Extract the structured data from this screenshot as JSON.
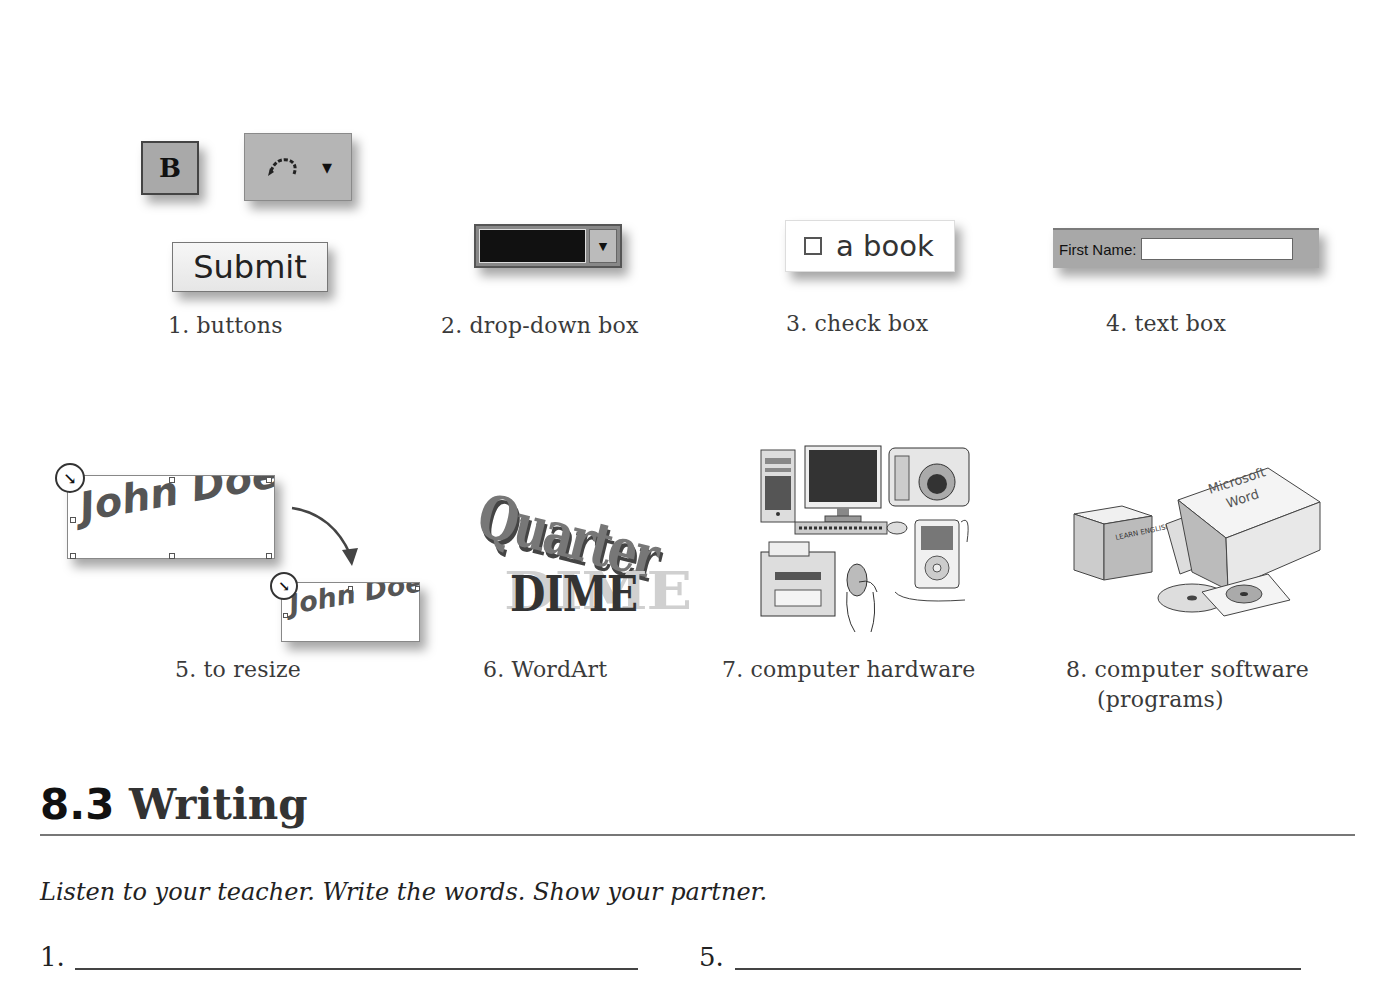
{
  "vocabulary": {
    "items": [
      {
        "number": "1.",
        "label": "buttons",
        "caption": "1. buttons"
      },
      {
        "number": "2.",
        "label": "drop-down box",
        "caption": "2. drop-down box"
      },
      {
        "number": "3.",
        "label": "check box",
        "caption": "3. check box"
      },
      {
        "number": "4.",
        "label": "text box",
        "caption": "4.  text box"
      },
      {
        "number": "5.",
        "label": "to resize",
        "caption": "5. to resize"
      },
      {
        "number": "6.",
        "label": "WordArt",
        "caption": "6. WordArt"
      },
      {
        "number": "7.",
        "label": "computer hardware",
        "caption": "7. computer hardware"
      },
      {
        "number": "8.",
        "label": "computer software (programs)",
        "caption_line1": "8. computer software",
        "caption_line2": "(programs)"
      }
    ]
  },
  "illustrations": {
    "buttons": {
      "bold_glyph": "B",
      "undo_icon": "undo-icon",
      "dropdown_icon": "▾",
      "submit_label": "Submit"
    },
    "dropdown": {
      "arrow": "▼"
    },
    "checkbox": {
      "label": "a book",
      "checked": false
    },
    "textbox": {
      "label": "First Name:",
      "value": ""
    },
    "resize": {
      "large_text": "John Doe",
      "small_text": "John Doe",
      "handle_icon": "↘"
    },
    "wordart": {
      "top_word": "Quarter",
      "bottom_word": "DIME",
      "bottom_word_shadow": "DIME"
    },
    "hardware": {
      "items": [
        "tower",
        "monitor",
        "keyboard",
        "mouse",
        "camera",
        "mp3 player",
        "printer",
        "hand on mouse"
      ]
    },
    "software": {
      "box1_text": "LEARN ENGLISH",
      "box2_text_line1": "Microsoft",
      "box2_text_line2": "Word"
    }
  },
  "section": {
    "number": "8.3",
    "title": "Writing",
    "instructions": "Listen to your teacher. Write the words. Show your partner.",
    "blanks": [
      {
        "number": "1.",
        "value": ""
      },
      {
        "number": "5.",
        "value": ""
      }
    ]
  },
  "colors": {
    "text": "#333333",
    "rule": "#777777",
    "button_gray": "#a9a9a9"
  }
}
